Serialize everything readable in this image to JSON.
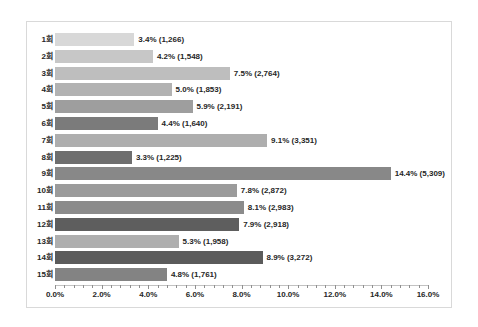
{
  "chart_data": {
    "type": "bar",
    "orientation": "horizontal",
    "title": "",
    "xlabel": "",
    "ylabel": "",
    "xlim": [
      0,
      16
    ],
    "grid": false,
    "legend": "none",
    "x_tick_labels": [
      "0.0%",
      "2.0%",
      "4.0%",
      "6.0%",
      "8.0%",
      "10.0%",
      "12.0%",
      "14.0%",
      "16.0%"
    ],
    "x_major_tick_step_pct": 2.0,
    "x_minor_tick_step_pct": 0.4,
    "categories": [
      "1회",
      "2회",
      "3회",
      "4회",
      "5회",
      "6회",
      "7회",
      "8회",
      "9회",
      "10회",
      "11회",
      "12회",
      "13회",
      "14회",
      "15회"
    ],
    "values_pct": [
      3.4,
      4.2,
      7.5,
      5.0,
      5.9,
      4.4,
      9.1,
      3.3,
      14.4,
      7.8,
      8.1,
      7.9,
      5.3,
      8.9,
      4.8
    ],
    "counts": [
      1266,
      1548,
      2764,
      1853,
      2191,
      1640,
      3351,
      1225,
      5309,
      2872,
      2983,
      2918,
      1958,
      3272,
      1761
    ],
    "value_labels": [
      "3.4% (1,266)",
      "4.2% (1,548)",
      "7.5% (2,764)",
      "5.0% (1,853)",
      "5.9% (2,191)",
      "4.4% (1,640)",
      "9.1% (3,351)",
      "3.3% (1,225)",
      "14.4% (5,309)",
      "7.8% (2,872)",
      "8.1% (2,983)",
      "7.9% (2,918)",
      "5.3% (1,958)",
      "8.9% (3,272)",
      "4.8% (1,761)"
    ],
    "bar_colors": [
      "#d8d8d8",
      "#c7c7c7",
      "#bebebe",
      "#b2b2b2",
      "#9e9e9e",
      "#7b7b7b",
      "#aeaeae",
      "#6e6e6e",
      "#888888",
      "#9b9b9b",
      "#8b8b8b",
      "#5e5e5e",
      "#aeaeae",
      "#5b5b5b",
      "#838383"
    ]
  },
  "ui": {
    "background_color": "#ffffff",
    "frame_border_color": "#d9d9d9",
    "text_color": "#262626",
    "axis_color": "#8f8f8f"
  }
}
